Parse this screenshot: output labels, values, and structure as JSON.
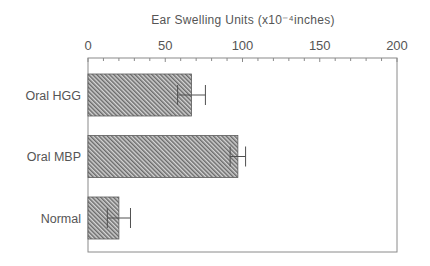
{
  "chart_data": {
    "type": "bar",
    "orientation": "horizontal",
    "title": "Ear Swelling Units (x10⁻⁴inches)",
    "xlabel": "Ear Swelling Units (x10⁻⁴inches)",
    "ylabel": "",
    "categories": [
      "Oral HGG",
      "Oral MBP",
      "Normal"
    ],
    "values": [
      67,
      97,
      20
    ],
    "errors": [
      9,
      5,
      7.5
    ],
    "xlim": [
      0,
      200
    ],
    "major_ticks": [
      0,
      50,
      100,
      150,
      200
    ],
    "tick_labels": [
      "0",
      "50",
      "100",
      "150",
      "200"
    ],
    "minor_tick_step": 10,
    "axis_position": "top",
    "grid": false,
    "legend": "none",
    "bar_fill": "diagonal-hatch",
    "colors": {
      "bar_dark": "#5a5a5a",
      "bar_light": "#d4d4d4",
      "axis": "#8a8a8a",
      "text": "#555555"
    }
  }
}
